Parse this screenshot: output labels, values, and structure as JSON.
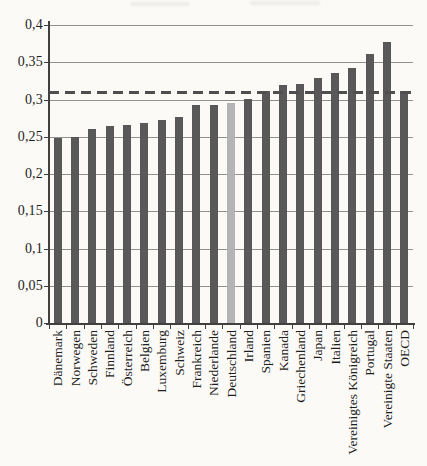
{
  "chart_data": {
    "type": "bar",
    "title": "",
    "categories": [
      "Dänemark",
      "Norwegen",
      "Schweden",
      "Finnland",
      "Österreich",
      "Belgien",
      "Luxemburg",
      "Schweiz",
      "Frankreich",
      "Niederlande",
      "Deutschland",
      "Irland",
      "Spanien",
      "Kanada",
      "Griechenland",
      "Japan",
      "Italien",
      "Vereinigtes Königreich",
      "Portugal",
      "Vereinigte Staaten",
      "OECD"
    ],
    "values": [
      0.248,
      0.25,
      0.26,
      0.264,
      0.266,
      0.269,
      0.272,
      0.276,
      0.292,
      0.293,
      0.295,
      0.301,
      0.311,
      0.319,
      0.321,
      0.329,
      0.336,
      0.342,
      0.361,
      0.377,
      0.311
    ],
    "highlighted_category": "Deutschland",
    "highlight_index": 10,
    "reference_line": {
      "value": 0.31,
      "style": "dashed"
    },
    "ylim": [
      0,
      0.4
    ],
    "y_ticks": [
      {
        "value": 0,
        "label": "0"
      },
      {
        "value": 0.05,
        "label": "0,05"
      },
      {
        "value": 0.1,
        "label": "0,1"
      },
      {
        "value": 0.15,
        "label": "0,15"
      },
      {
        "value": 0.2,
        "label": "0,2"
      },
      {
        "value": 0.25,
        "label": "0,25"
      },
      {
        "value": 0.3,
        "label": "0,3"
      },
      {
        "value": 0.35,
        "label": "0,35"
      },
      {
        "value": 0.4,
        "label": "0,4"
      }
    ],
    "grid": true,
    "legend": "none",
    "decimal_separator": ",",
    "colors": {
      "bar": "#595959",
      "highlight_bar": "#b4b4b4",
      "reference_line": "#4f4f4f",
      "gridline": "#909090",
      "axis": "#404040",
      "background": "#fbfaf6",
      "text": "#1e1e1e"
    }
  }
}
